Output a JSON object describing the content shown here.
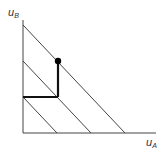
{
  "diagram": {
    "type": "utility-possibility",
    "axes": {
      "y_label": "u",
      "y_label_sub": "B",
      "x_label": "u",
      "x_label_sub": "A"
    },
    "frontier_lines": [
      {
        "name": "outer",
        "from": [
          23,
          25
        ],
        "to": [
          125,
          133
        ]
      },
      {
        "name": "middle",
        "from": [
          23,
          61
        ],
        "to": [
          91,
          133
        ]
      },
      {
        "name": "inner",
        "from": [
          23,
          97
        ],
        "to": [
          57,
          133
        ]
      }
    ],
    "path": {
      "horizontal": {
        "from": [
          23,
          97
        ],
        "to": [
          58,
          97
        ]
      },
      "vertical": {
        "from": [
          58,
          97
        ],
        "to": [
          58,
          61
        ]
      }
    },
    "point": {
      "cx": 58,
      "cy": 61
    },
    "colors": {
      "line": "#333333",
      "path": "#111111",
      "point": "#000000"
    }
  }
}
